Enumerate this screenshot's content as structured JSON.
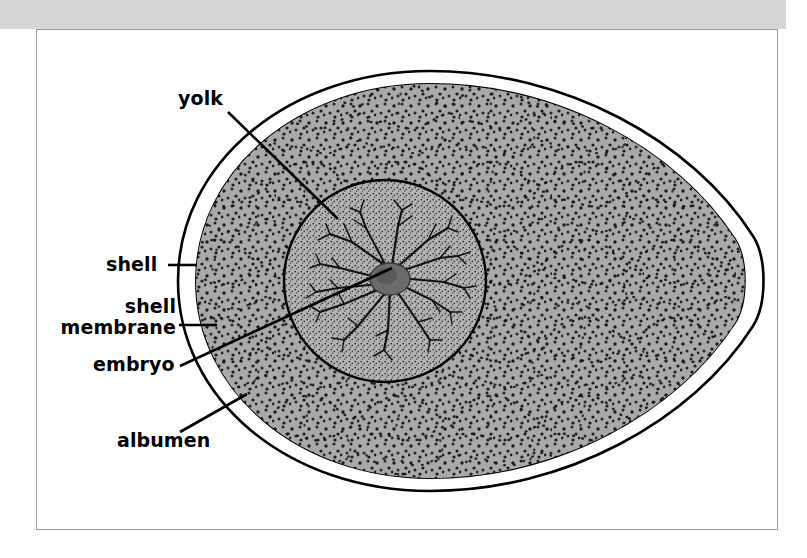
{
  "figure": {
    "background_color": "#ffffff",
    "scan_band_color": "#d6d6d6",
    "frame_color": "#9a9a9a",
    "ink_color": "#000000",
    "albumen_fill": "#a9a9a9",
    "yolk_fill": "#b2b2b2",
    "embryo_fill": "#6f6f6f"
  },
  "labels": [
    {
      "id": "yolk",
      "text": "yolk",
      "lines": [
        "yolk"
      ]
    },
    {
      "id": "shell",
      "text": "shell",
      "lines": [
        "shell"
      ]
    },
    {
      "id": "shell_membrane",
      "text": "shell membrane",
      "lines": [
        "shell",
        "membrane"
      ]
    },
    {
      "id": "embryo",
      "text": "embryo",
      "lines": [
        "embryo"
      ]
    },
    {
      "id": "albumen",
      "text": "albumen",
      "lines": [
        "albumen"
      ]
    }
  ],
  "label_text": {
    "yolk": "yolk",
    "shell": "shell",
    "shell_membrane_line1": "shell",
    "shell_membrane_line2": "membrane",
    "embryo": "embryo",
    "albumen": "albumen"
  },
  "parts": [
    {
      "name": "shell",
      "description": "outer hard calcified casing drawn as the outermost contour line of the egg"
    },
    {
      "name": "shell membrane",
      "description": "thin inner lining drawn as a second contour just inside the shell, separated by a white gap"
    },
    {
      "name": "albumen",
      "description": "egg white, shown as the large coarse-stippled gray region filling the egg interior"
    },
    {
      "name": "yolk",
      "description": "central circle with fine dense stippling, lighter than the albumen"
    },
    {
      "name": "embryo",
      "description": "dark blob at the centre of the yolk with branching blood vessels radiating out"
    }
  ],
  "leader_lines": [
    {
      "for": "yolk",
      "from": [
        228,
        112
      ],
      "to": [
        338,
        219
      ]
    },
    {
      "for": "shell",
      "from": [
        168,
        265
      ],
      "to": [
        196,
        265
      ]
    },
    {
      "for": "shell_membrane",
      "from": [
        179,
        325
      ],
      "to": [
        216,
        325
      ]
    },
    {
      "for": "embryo",
      "from": [
        180,
        366
      ],
      "to": [
        392,
        268
      ]
    },
    {
      "for": "albumen",
      "from": [
        180,
        432
      ],
      "to": [
        247,
        394
      ]
    }
  ]
}
